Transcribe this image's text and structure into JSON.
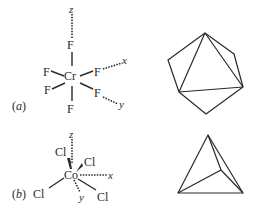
{
  "panels": [
    {
      "id": "a",
      "label_open": "(",
      "label_letter": "a",
      "label_close": ")",
      "central_atom": "Cr",
      "ligands": [
        "F",
        "F",
        "F",
        "F",
        "F",
        "F"
      ],
      "axes": {
        "x": "x",
        "y": "y",
        "z": "z"
      },
      "geometry": "octahedron"
    },
    {
      "id": "b",
      "label_open": "(",
      "label_letter": "b",
      "label_close": ")",
      "central_atom": "Co",
      "ligands": [
        "Cl",
        "Cl",
        "Cl",
        "Cl"
      ],
      "axes": {
        "x": "x",
        "y": "y",
        "z": "z"
      },
      "geometry": "tetrahedron"
    }
  ],
  "colors": {
    "ink": "#2a2a2a",
    "background": "#ffffff"
  }
}
